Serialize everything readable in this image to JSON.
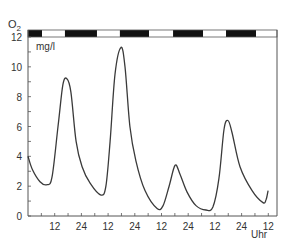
{
  "chart_data": {
    "type": "line",
    "title": "",
    "ylabel": "O2",
    "ylabel_sub": "2",
    "ylabel_main": "O",
    "unit": "mg/l",
    "xlabel": "Uhr",
    "ylim": [
      0,
      12
    ],
    "xlim_hours": [
      0,
      112
    ],
    "y_ticks": [
      0,
      2,
      4,
      6,
      8,
      10,
      12
    ],
    "y_tick_labels": [
      "0",
      "2",
      "4",
      "6",
      "8",
      "10",
      "12"
    ],
    "x_tick_positions_hours": [
      12,
      24,
      36,
      48,
      60,
      72,
      84,
      96,
      108
    ],
    "x_tick_labels": [
      "12",
      "24",
      "12",
      "24",
      "12",
      "24",
      "12",
      "24",
      "12"
    ],
    "grid": false,
    "day_night_bar": [
      {
        "from": 0,
        "to": 6.3,
        "phase": "night"
      },
      {
        "from": 6.3,
        "to": 16.6,
        "phase": "day"
      },
      {
        "from": 16.6,
        "to": 31,
        "phase": "night"
      },
      {
        "from": 31,
        "to": 41.3,
        "phase": "day"
      },
      {
        "from": 41.3,
        "to": 54.4,
        "phase": "night"
      },
      {
        "from": 54.4,
        "to": 65.2,
        "phase": "day"
      },
      {
        "from": 65.2,
        "to": 78.7,
        "phase": "night"
      },
      {
        "from": 78.7,
        "to": 89,
        "phase": "day"
      },
      {
        "from": 89,
        "to": 102.5,
        "phase": "night"
      },
      {
        "from": 102.5,
        "to": 112,
        "phase": "day"
      }
    ],
    "series": [
      {
        "name": "O2 concentration",
        "x_hours": [
          0,
          2,
          5.4,
          8.5,
          10.8,
          13.5,
          15.7,
          17.5,
          19.3,
          21.6,
          24.3,
          27.9,
          32.8,
          35,
          36.9,
          39.1,
          41.8,
          43.6,
          45.8,
          48.5,
          52.6,
          58,
          60.7,
          63.4,
          66.1,
          68.3,
          71.5,
          75.5,
          80,
          83.1,
          85.8,
          88.1,
          89.9,
          91.7,
          95.3,
          100.7,
          105.6,
          107,
          107.9
        ],
        "values": [
          4.0,
          3.1,
          2.3,
          2.1,
          2.6,
          6.0,
          8.8,
          9.2,
          8.3,
          5.0,
          3.3,
          2.2,
          1.4,
          2.0,
          5.0,
          9.5,
          11.3,
          10.0,
          6.0,
          3.7,
          1.7,
          0.5,
          0.7,
          2.0,
          3.4,
          2.8,
          1.6,
          0.7,
          0.4,
          0.6,
          2.5,
          5.8,
          6.4,
          5.6,
          3.3,
          1.7,
          0.9,
          1.1,
          1.7
        ]
      }
    ]
  },
  "colors": {
    "line": "#3a3a3a",
    "axis": "#555555",
    "night": "#111111",
    "day": "#ffffff"
  }
}
